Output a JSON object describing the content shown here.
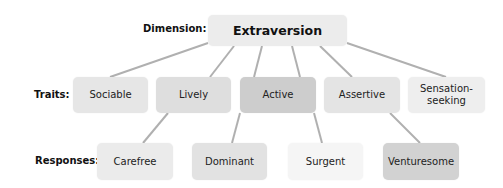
{
  "labels": {
    "dimension": "Dimension:",
    "traits": "Traits:",
    "responses": "Responses:"
  },
  "dimension": {
    "label": "Extraversion",
    "color": "#ececec"
  },
  "traits": [
    {
      "label": "Sociable",
      "color": "#e6e6e6"
    },
    {
      "label": "Lively",
      "color": "#dedede"
    },
    {
      "label": "Active",
      "color": "#cdcdcd"
    },
    {
      "label": "Assertive",
      "color": "#e4e4e4"
    },
    {
      "label": "Sensation-\nseeking",
      "color": "#eeeeee"
    }
  ],
  "responses": [
    {
      "label": "Carefree",
      "color": "#ebebeb"
    },
    {
      "label": "Dominant",
      "color": "#e2e2e2"
    },
    {
      "label": "Surgent",
      "color": "#f5f5f5"
    },
    {
      "label": "Venturesome",
      "color": "#d2d2d2"
    }
  ],
  "connectors": {
    "dimension_to_traits": [
      "Sociable",
      "Lively",
      "Active",
      "Assertive",
      "Sensation-seeking"
    ],
    "trait_to_response": [
      {
        "from": "Lively",
        "to": "Carefree"
      },
      {
        "from": "Active",
        "to": "Dominant"
      },
      {
        "from": "Active",
        "to": "Surgent"
      },
      {
        "from": "Assertive",
        "to": "Venturesome"
      }
    ],
    "color": "#b0b0b0"
  }
}
